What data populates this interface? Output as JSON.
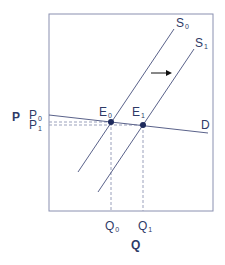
{
  "diagram": {
    "type": "supply-demand",
    "axes": {
      "x_label": "Q",
      "y_label": "P"
    },
    "curves": [
      {
        "name": "S",
        "sub": "0",
        "kind": "supply"
      },
      {
        "name": "S",
        "sub": "1",
        "kind": "supply"
      },
      {
        "name": "D",
        "kind": "demand"
      }
    ],
    "points": [
      {
        "name": "E",
        "sub": "0"
      },
      {
        "name": "E",
        "sub": "1"
      }
    ],
    "ticks": {
      "price": [
        {
          "name": "P",
          "sub": "0"
        },
        {
          "name": "P",
          "sub": "1"
        }
      ],
      "quantity": [
        {
          "name": "Q",
          "sub": "0"
        },
        {
          "name": "Q",
          "sub": "1"
        }
      ]
    },
    "annotation": "rightward shift arrow",
    "colors": {
      "line": "#3a4372",
      "dashed": "#9aa0bb",
      "point": "#1e2a5c",
      "frame": "#7b82a6"
    }
  }
}
